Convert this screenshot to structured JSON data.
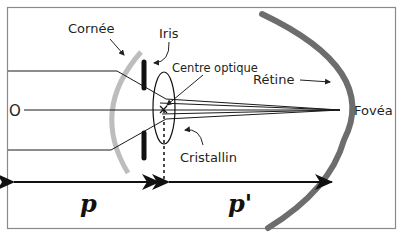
{
  "diagram": {
    "labels": {
      "cornea": "Cornée",
      "iris": "Iris",
      "optical_center": "Centre optique",
      "retina": "Rétine",
      "fovea": "Fovéa",
      "lens": "Cristallin",
      "object": "O",
      "object_distance": "p",
      "image_distance": "p'"
    },
    "colors": {
      "frame": "#8a8a8a",
      "cornea": "#bdbdbd",
      "retina": "#6d6d6d",
      "iris": "#111111",
      "rays": "#1a1a1a",
      "text": "#231f20"
    }
  }
}
